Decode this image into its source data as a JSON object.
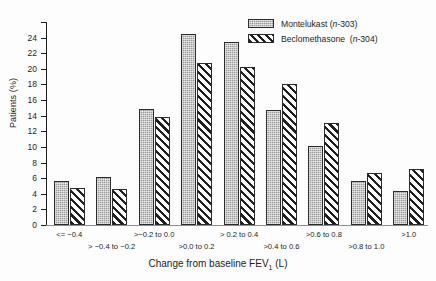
{
  "chart_data": {
    "type": "bar",
    "title": "",
    "xlabel": "Change from baseline FEV1 (L)",
    "xlabel_parts": {
      "pre": "Change from baseline FEV",
      "sub": "1",
      "post": " (L)"
    },
    "ylabel": "Patients (%)",
    "ylim": [
      0,
      26
    ],
    "ytick_step": 2,
    "yticks": [
      0,
      2,
      4,
      6,
      8,
      10,
      12,
      14,
      16,
      18,
      20,
      22,
      24,
      26
    ],
    "ytick_labels": [
      "0",
      "2",
      "4",
      "6",
      "8",
      "10",
      "12",
      "14",
      "16",
      "18",
      "20",
      "22",
      "24",
      ""
    ],
    "grid": false,
    "legend_position": "top-right",
    "categories": [
      "<= −0.4",
      "> −0.4 to −0.2",
      ">−0.2 to 0.0",
      ">0.0 to 0.2",
      "> 0.2 to 0.4",
      ">0.4 to 0.6",
      ">0.6 to 0.8",
      ">0.8 to 1.0",
      ">1.0"
    ],
    "category_rows": [
      0,
      1,
      0,
      1,
      0,
      1,
      0,
      1,
      0
    ],
    "series": [
      {
        "name": "Montelukast",
        "n": "303",
        "legend_label": "Montelukast (n-303)",
        "values": [
          5.7,
          6.2,
          14.9,
          24.5,
          23.4,
          14.7,
          10.1,
          5.7,
          4.3
        ]
      },
      {
        "name": "Beclomethasone",
        "n": "304",
        "legend_label": "Beclomethasone  (n-304)",
        "values": [
          4.7,
          4.6,
          13.8,
          20.8,
          20.3,
          18.0,
          13.1,
          6.6,
          7.2
        ]
      }
    ]
  },
  "colors": {
    "montelukast_fill": "#9a9a9a",
    "beclomethasone_fill": "#ffffff",
    "outline": "#2b2b2b",
    "axis": "#1d1d1d",
    "background": "#fdfdfd"
  }
}
